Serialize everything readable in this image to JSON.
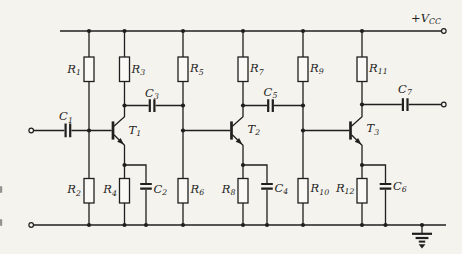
{
  "colors": {
    "paper": "#f5f3ee",
    "ink": "#1f1f1e"
  },
  "supply": {
    "sym": "+V",
    "sub": "CC"
  },
  "schematic": {
    "resistors": [
      {
        "id": "R1",
        "sym": "R",
        "sub": "1"
      },
      {
        "id": "R2",
        "sym": "R",
        "sub": "2"
      },
      {
        "id": "R3",
        "sym": "R",
        "sub": "3"
      },
      {
        "id": "R4",
        "sym": "R",
        "sub": "4"
      },
      {
        "id": "R5",
        "sym": "R",
        "sub": "5"
      },
      {
        "id": "R6",
        "sym": "R",
        "sub": "6"
      },
      {
        "id": "R7",
        "sym": "R",
        "sub": "7"
      },
      {
        "id": "R8",
        "sym": "R",
        "sub": "8"
      },
      {
        "id": "R9",
        "sym": "R",
        "sub": "9"
      },
      {
        "id": "R10",
        "sym": "R",
        "sub": "10"
      },
      {
        "id": "R11",
        "sym": "R",
        "sub": "11"
      },
      {
        "id": "R12",
        "sym": "R",
        "sub": "12"
      }
    ],
    "capacitors": [
      {
        "id": "C1",
        "sym": "C",
        "sub": "1"
      },
      {
        "id": "C2",
        "sym": "C",
        "sub": "2"
      },
      {
        "id": "C3",
        "sym": "C",
        "sub": "3"
      },
      {
        "id": "C4",
        "sym": "C",
        "sub": "4"
      },
      {
        "id": "C5",
        "sym": "C",
        "sub": "5"
      },
      {
        "id": "C6",
        "sym": "C",
        "sub": "6"
      },
      {
        "id": "C7",
        "sym": "C",
        "sub": "7"
      }
    ],
    "transistors": [
      {
        "id": "T1",
        "sym": "T",
        "sub": "1"
      },
      {
        "id": "T2",
        "sym": "T",
        "sub": "2"
      },
      {
        "id": "T3",
        "sym": "T",
        "sub": "3"
      }
    ]
  }
}
